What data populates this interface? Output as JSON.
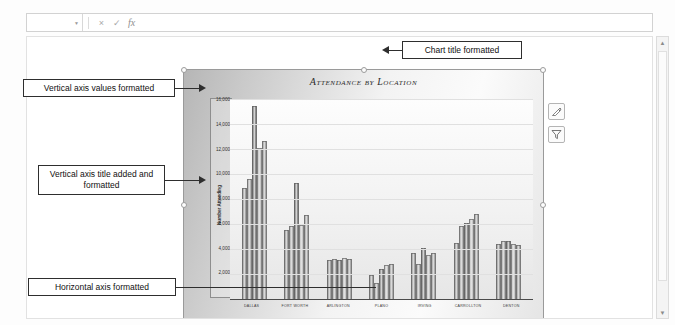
{
  "app": {
    "formula_bar": {
      "name_box_value": "",
      "cancel_label": "×",
      "enter_label": "✓",
      "function_label": "fx",
      "formula_value": "",
      "formula_placeholder": ""
    },
    "scrollbar": {
      "up_arrow": "▲",
      "down_arrow": "▼"
    }
  },
  "chart": {
    "title": "Attendance by Location",
    "styles_button_label": "Chart Styles",
    "filters_button_label": "Chart Filters"
  },
  "callouts": [
    {
      "id": "vertical-axis-values",
      "text": "Vertical axis values formatted"
    },
    {
      "id": "vertical-axis-title",
      "text": "Vertical axis title added and formatted"
    },
    {
      "id": "horizontal-axis",
      "text": "Horizontal axis formatted"
    },
    {
      "id": "chart-title",
      "text": "Chart title formatted"
    }
  ],
  "chart_data": {
    "type": "bar",
    "title": "Attendance by Location",
    "xlabel": "",
    "ylabel": "Number Attending",
    "ylim": [
      0,
      16000
    ],
    "ytick_values": [
      2000,
      4000,
      6000,
      8000,
      10000,
      12000,
      14000,
      16000
    ],
    "ytick_labels": [
      "2,000",
      "4,000",
      "6,000",
      "8,000",
      "10,000",
      "12,000",
      "14,000",
      "16,000"
    ],
    "grid": true,
    "legend_position": "bottom",
    "categories": [
      "DALLAS",
      "FORT WORTH",
      "ARLINGTON",
      "PLANO",
      "IRVING",
      "CARROLLTON",
      "DENTON"
    ],
    "series": [
      {
        "name": "Year 1",
        "color": "#8c8c8c",
        "values": [
          9000,
          5600,
          3200,
          2000,
          3800,
          4600,
          4500
        ]
      },
      {
        "name": "Year 2",
        "color": "#a3a3a3",
        "values": [
          9700,
          5900,
          3300,
          1400,
          2900,
          5900,
          4700
        ]
      },
      {
        "name": "Year 3",
        "color": "#6f6f6f",
        "values": [
          15500,
          9400,
          3200,
          2500,
          4200,
          6200,
          4700
        ]
      },
      {
        "name": "Year 4",
        "color": "#bdbdbd",
        "values": [
          12200,
          6000,
          3400,
          2800,
          3600,
          6500,
          4500
        ]
      },
      {
        "name": "Year 5",
        "color": "#969696",
        "values": [
          12700,
          6800,
          3300,
          2900,
          3800,
          6900,
          4400
        ]
      }
    ]
  }
}
